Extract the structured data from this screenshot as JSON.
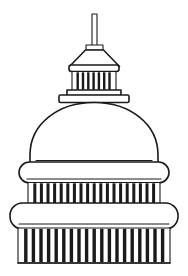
{
  "artwork": {
    "title": "United States Capitol Dome",
    "subject": "capitol-dome-line-drawing",
    "style": "black-and-white line art",
    "alt_text": "Line drawing of the United States Capitol dome with flagpole spire, lantern colonnade, dome, and two tiers of columns"
  },
  "canvas": {
    "width": 188,
    "height": 276,
    "background_color": "#ffffff",
    "ink_color": "#1a1a1a"
  },
  "parts": [
    {
      "id": "flagpole",
      "label": "Flagpole spire",
      "x": 92,
      "y_top": 14,
      "y_bottom": 46,
      "width": 5
    },
    {
      "id": "pole-base",
      "label": "Flagpole base block",
      "x": 86,
      "y": 45,
      "width": 17,
      "height": 5
    },
    {
      "id": "tholos-roof",
      "label": "Conical lantern roof",
      "y_top": 50,
      "y_bottom": 66,
      "top_width": 18,
      "bottom_width": 60
    },
    {
      "id": "lantern-entablature",
      "label": "Lantern entablature",
      "x": 70,
      "y": 65,
      "width": 48,
      "height": 6
    },
    {
      "id": "lantern-colonnade",
      "label": "Lantern colonnade",
      "x": 72,
      "y": 71,
      "width": 44,
      "height": 19,
      "column_count": 8
    },
    {
      "id": "lantern-plinth-upper",
      "label": "Lantern upper plinth",
      "x": 68,
      "y": 90,
      "width": 52,
      "height": 5
    },
    {
      "id": "lantern-plinth-lower",
      "label": "Lantern lower plinth",
      "x": 60,
      "y": 95,
      "width": 68,
      "height": 7
    },
    {
      "id": "dome-shell",
      "label": "Main dome shell",
      "y_top": 102,
      "y_bottom": 166,
      "left": 30,
      "right": 158
    },
    {
      "id": "dome-base-line",
      "label": "Dome base line",
      "y": 160,
      "left": 36,
      "right": 152
    },
    {
      "id": "upper-cornice",
      "label": "Upper cornice band",
      "x": 19,
      "y": 162,
      "width": 150,
      "height": 20,
      "corner_radius": 10
    },
    {
      "id": "upper-colonnade",
      "label": "Upper colonnade",
      "x": 28,
      "y": 182,
      "width": 132,
      "height": 25,
      "column_count": 20
    },
    {
      "id": "lower-cornice",
      "label": "Lower cornice band",
      "x": 10,
      "y": 203,
      "width": 168,
      "height": 25,
      "corner_radius": 12
    },
    {
      "id": "lower-colonnade",
      "label": "Lower colonnade",
      "x": 18,
      "y": 228,
      "width": 152,
      "height": 36,
      "column_count": 20
    },
    {
      "id": "base-plinth",
      "label": "Base plinth",
      "x": 18,
      "y": 262,
      "width": 152,
      "height": 4
    }
  ],
  "counts": {
    "lantern_columns": 8,
    "upper_columns": 20,
    "lower_columns": 20,
    "cornice_bands": 2,
    "colonnade_tiers": 3
  }
}
